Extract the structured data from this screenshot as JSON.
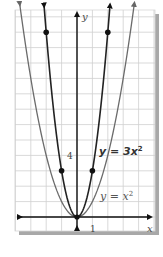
{
  "chart_data": {
    "type": "line",
    "title": "",
    "xlabel": "x",
    "ylabel": "y",
    "grid": true,
    "x_tick_labels": [
      {
        "value": 1,
        "label": "1"
      }
    ],
    "y_tick_labels": [
      {
        "value": 4,
        "label": "4"
      }
    ],
    "xlim": [
      -4,
      5
    ],
    "ylim": [
      -1,
      13.5
    ],
    "series": [
      {
        "name": "y = x^2",
        "label": "y = x²",
        "equation": "y = x^2",
        "color": "#6b6b6b",
        "points": [],
        "x_range": [
          -3.7,
          3.7
        ]
      },
      {
        "name": "y = 3x^2",
        "label": "y = 3x²",
        "equation": "y = 3x^2",
        "color": "#222222",
        "points": [
          {
            "x": -2,
            "y": 12
          },
          {
            "x": -1,
            "y": 3
          },
          {
            "x": 0,
            "y": 0
          },
          {
            "x": 1,
            "y": 3
          },
          {
            "x": 2,
            "y": 12
          }
        ],
        "x_range": [
          -2.1,
          2.1
        ]
      }
    ],
    "annotations": [
      {
        "text": "y = 3x²",
        "near": {
          "x": 1.5,
          "y": 4.5
        },
        "bold": true
      },
      {
        "text": "y = x²",
        "near": {
          "x": 1.5,
          "y": 1.5
        },
        "bold": false
      }
    ]
  },
  "labels": {
    "x_axis": "x",
    "y_axis": "y",
    "tick_x1": "1",
    "tick_y4": "4",
    "curve_3x2": "y = 3",
    "curve_3x2_var": "x",
    "curve_3x2_exp": "2",
    "curve_x2": "y = ",
    "curve_x2_var": "x",
    "curve_x2_exp": "2"
  },
  "colors": {
    "grid": "#cfcfcf",
    "axis": "#111111",
    "shadow": "#a8a8a8",
    "curve_x2": "#6b6b6b",
    "curve_3x2": "#222222"
  }
}
